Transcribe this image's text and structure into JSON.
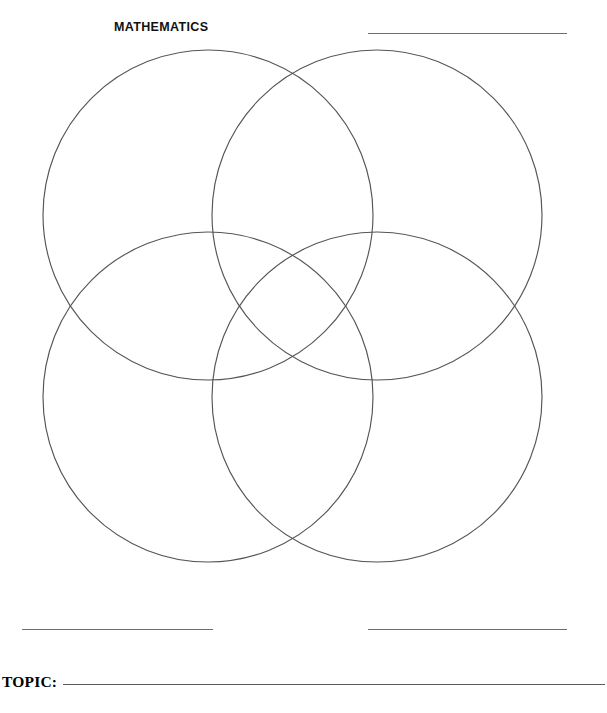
{
  "page": {
    "width": 607,
    "height": 713,
    "background_color": "#ffffff",
    "stroke_color": "#555555",
    "rule_color": "#6d6d6d",
    "text_color": "#111111"
  },
  "header": {
    "subject_label": "MATHEMATICS",
    "blank_line_right": ""
  },
  "diagram": {
    "type": "venn",
    "circle_count": 4,
    "circles": [
      {
        "id": "top-left",
        "cx": 208,
        "cy": 215,
        "r": 165,
        "label": ""
      },
      {
        "id": "top-right",
        "cx": 377,
        "cy": 215,
        "r": 165,
        "label": ""
      },
      {
        "id": "bottom-left",
        "cx": 208,
        "cy": 397,
        "r": 165,
        "label": ""
      },
      {
        "id": "bottom-right",
        "cx": 377,
        "cy": 397,
        "r": 165,
        "label": ""
      }
    ]
  },
  "footer": {
    "blank_line_bottom_left": "",
    "blank_line_bottom_right": "",
    "topic_label": "TOPIC:",
    "topic_value": ""
  }
}
